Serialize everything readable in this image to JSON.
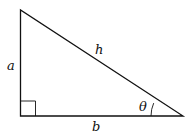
{
  "diagram": {
    "type": "right-triangle",
    "vertices": {
      "top": [
        20.5,
        10
      ],
      "right_angle": [
        20.5,
        116
      ],
      "acute": [
        183,
        116
      ]
    },
    "right_angle_marker_size": 15,
    "angle_arc_radius": 32,
    "stroke_color": "#111111",
    "labels": {
      "vertical_side": "a",
      "horizontal_side": "b",
      "hypotenuse": "h",
      "angle": "θ"
    }
  }
}
